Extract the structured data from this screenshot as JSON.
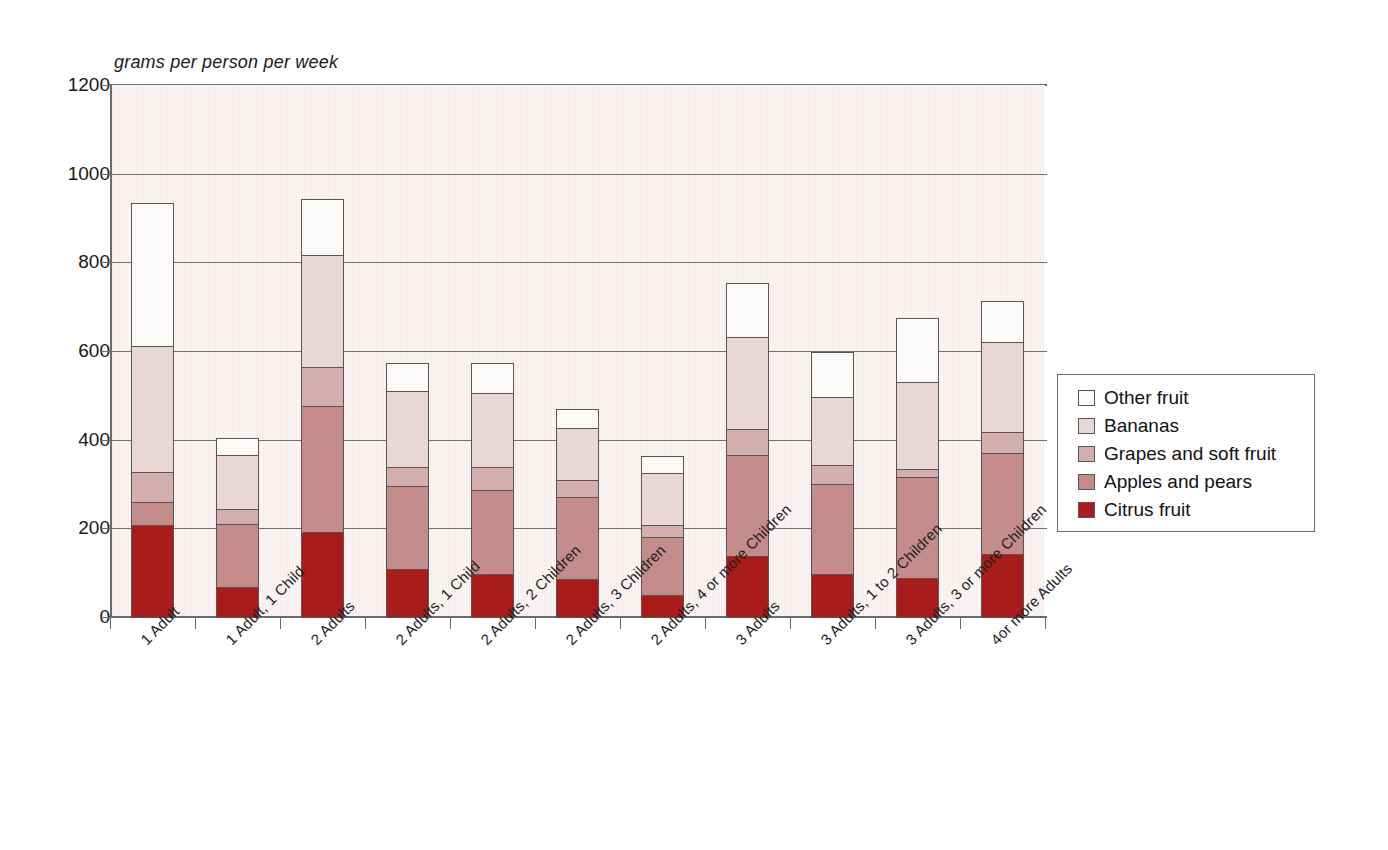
{
  "chart_data": {
    "type": "bar",
    "stacked": true,
    "title": "",
    "subtitle": "",
    "xlabel": "",
    "ylabel": "grams per person per week",
    "ylim": [
      0,
      1200
    ],
    "ytick_step": 200,
    "yticks": [
      1200,
      1000,
      800,
      600,
      400,
      200,
      0
    ],
    "grid": true,
    "legend_position": "right",
    "categories": [
      "1 Adult",
      "1 Adult, 1 Child",
      "2 Adults",
      "2 Adults, 1 Child",
      "2 Adults, 2 Children",
      "2 Adults, 3 Children",
      "2 Adults, 4 or more Children",
      "3 Adults",
      "3 Adults, 1 to 2 Children",
      "3 Adults, 3 or more Children",
      "4or more Adults"
    ],
    "series": [
      {
        "name": "Citrus fruit",
        "color": "#a81c1c",
        "values": [
          210,
          70,
          195,
          110,
          100,
          88,
          52,
          140,
          100,
          90,
          145
        ]
      },
      {
        "name": "Apples and pears",
        "color": "#c48b8b",
        "values": [
          55,
          145,
          285,
          190,
          190,
          187,
          133,
          230,
          205,
          230,
          230
        ]
      },
      {
        "name": "Grapes and soft fruit",
        "color": "#d3aeae",
        "values": [
          70,
          35,
          90,
          45,
          55,
          40,
          30,
          60,
          45,
          20,
          50
        ]
      },
      {
        "name": "Bananas",
        "color": "#e9d6d6",
        "values": [
          285,
          125,
          255,
          175,
          170,
          120,
          120,
          210,
          155,
          200,
          205
        ]
      },
      {
        "name": "Other fruit",
        "color": "#fdfafa",
        "values": [
          325,
          40,
          130,
          65,
          70,
          45,
          40,
          125,
          105,
          145,
          95
        ]
      }
    ],
    "cumulative_tops": [
      [
        210,
        265,
        335,
        620,
        945
      ],
      [
        70,
        215,
        250,
        375,
        415
      ],
      [
        195,
        480,
        570,
        825,
        955
      ],
      [
        110,
        300,
        345,
        520,
        585
      ],
      [
        100,
        290,
        345,
        515,
        585
      ],
      [
        88,
        275,
        315,
        435,
        480
      ],
      [
        52,
        185,
        215,
        335,
        375
      ],
      [
        140,
        370,
        430,
        640,
        765
      ],
      [
        100,
        305,
        350,
        505,
        610
      ],
      [
        90,
        320,
        340,
        540,
        685
      ],
      [
        145,
        375,
        425,
        630,
        725
      ]
    ],
    "totals": [
      945,
      415,
      955,
      585,
      585,
      480,
      375,
      765,
      610,
      685,
      725
    ]
  },
  "legend": {
    "items": [
      {
        "label": "Other fruit",
        "color": "#fdfafa"
      },
      {
        "label": "Bananas",
        "color": "#e9d6d6"
      },
      {
        "label": "Grapes and soft fruit",
        "color": "#d3aeae"
      },
      {
        "label": "Apples and pears",
        "color": "#c48b8b"
      },
      {
        "label": "Citrus fruit",
        "color": "#a81c1c"
      }
    ]
  },
  "style": {
    "plot_background": "#f8eeee",
    "axis_color": "#6b6b6b",
    "page_background": "#ffffff",
    "bar_border": "#5d5252"
  }
}
